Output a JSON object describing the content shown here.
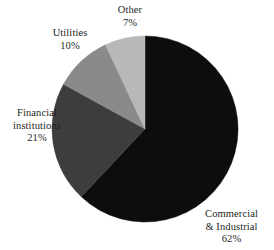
{
  "chart_data": {
    "type": "pie",
    "title": "",
    "subtitle": "",
    "xlabel": "",
    "ylabel": "",
    "legend_position": "none",
    "grid": false,
    "units": "percent",
    "start_angle_deg": 0,
    "direction": "clockwise",
    "categories": [
      "Commercial & Industrial",
      "Financial institutions",
      "Utilities",
      "Other"
    ],
    "values": [
      62,
      21,
      10,
      7
    ],
    "slices": [
      {
        "name": "Commercial & Industrial",
        "value": 62,
        "value_label": "62%",
        "color": "#0d0d0d",
        "label_lines": [
          "Commercial",
          "& Industrial"
        ],
        "label_percent": "62%"
      },
      {
        "name": "Financial institutions",
        "value": 21,
        "value_label": "21%",
        "color": "#3d3d3d",
        "label_lines": [
          "Financial",
          "institutions"
        ],
        "label_percent": "21%"
      },
      {
        "name": "Utilities",
        "value": 10,
        "value_label": "10%",
        "color": "#8a8a8a",
        "label_lines": [
          "Utilities"
        ],
        "label_percent": "10%"
      },
      {
        "name": "Other",
        "value": 7,
        "value_label": "7%",
        "color": "#b8b8b8",
        "label_lines": [
          "Other"
        ],
        "label_percent": "7%"
      }
    ]
  },
  "labels": {
    "other": {
      "line1": "Other",
      "percent": "7%"
    },
    "utilities": {
      "line1": "Utilities",
      "percent": "10%"
    },
    "financial": {
      "line1": "Financial",
      "line2": "institutions",
      "percent": "21%"
    },
    "commercial": {
      "line1": "Commercial",
      "line2": "& Industrial",
      "percent": "62%"
    }
  },
  "colors": {
    "background": "#ffffff",
    "text": "#231f1e",
    "commercial": "#0d0d0d",
    "financial": "#3d3d3d",
    "utilities": "#8a8a8a",
    "other": "#b8b8b8"
  },
  "geometry": {
    "center_x": 145,
    "center_y": 129,
    "radius": 93
  }
}
